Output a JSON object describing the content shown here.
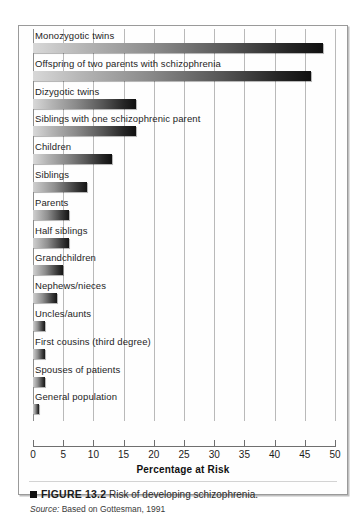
{
  "figure": {
    "marker": "black-square",
    "figure_number": "FIGURE 13.2",
    "caption": "Risk of developing schizophrenia.",
    "source_label": "Source:",
    "source_text": "Based on Gottesman, 1991"
  },
  "chart_data": {
    "type": "bar",
    "orientation": "horizontal",
    "title": "Risk of developing schizophrenia.",
    "xlabel": "Percentage at Risk",
    "ylabel": "",
    "xlim": [
      0,
      50
    ],
    "xticks": [
      0,
      5,
      10,
      15,
      20,
      25,
      30,
      35,
      40,
      45,
      50
    ],
    "xtick_labels": [
      "0",
      "5",
      "10",
      "15",
      "20",
      "25",
      "30",
      "35",
      "40",
      "45",
      "50"
    ],
    "grid": "vertical-gridlines-at-xticks",
    "legend": "none",
    "bar_style": "gradient-light-to-dark-left-to-right",
    "categories": [
      "Monozygotic twins",
      "Offspring of two parents with schizophrenia",
      "Dizygotic twins",
      "Siblings with one schizophrenic parent",
      "Children",
      "Siblings",
      "Parents",
      "Half siblings",
      "Grandchildren",
      "Nephews/nieces",
      "Uncles/aunts",
      "First cousins (third degree)",
      "Spouses of patients",
      "General population"
    ],
    "values": [
      48,
      46,
      17,
      17,
      13,
      9,
      6,
      6,
      5,
      4,
      2,
      2,
      2,
      1
    ]
  }
}
